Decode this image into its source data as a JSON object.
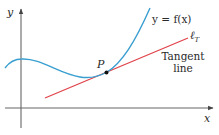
{
  "diagram": {
    "type": "tangent-line-illustration",
    "colors": {
      "curve": "#3a9fd0",
      "tangent": "#e0434a",
      "axes": "#555555",
      "point": "#111111",
      "text": "#2a2a2a",
      "background": "#ffffff"
    },
    "axes": {
      "x_label": "x",
      "y_label": "y"
    },
    "curve": {
      "label": "y = f(x)"
    },
    "point": {
      "label": "P"
    },
    "tangent": {
      "symbol_main": "ℓ",
      "symbol_sub": "T",
      "caption_line1": "Tangent",
      "caption_line2": "line"
    }
  }
}
